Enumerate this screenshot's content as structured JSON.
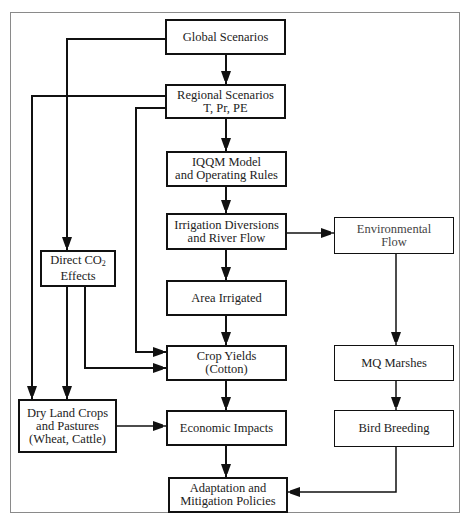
{
  "diagram": {
    "nodes": [
      {
        "id": "global",
        "lines": [
          "Global Scenarios"
        ]
      },
      {
        "id": "regional",
        "lines": [
          "Regional Scenarios",
          "T, Pr, PE"
        ]
      },
      {
        "id": "iqqm",
        "lines": [
          "IQQM Model",
          "and Operating Rules"
        ]
      },
      {
        "id": "irrigation",
        "lines": [
          "Irrigation Diversions",
          "and River Flow"
        ]
      },
      {
        "id": "environmental",
        "lines": [
          "Environmental",
          "Flow"
        ]
      },
      {
        "id": "co2",
        "lines": [
          "Direct CO",
          "2",
          "Effects"
        ]
      },
      {
        "id": "area",
        "lines": [
          "Area Irrigated"
        ]
      },
      {
        "id": "crop",
        "lines": [
          "Crop Yields",
          "(Cotton)"
        ]
      },
      {
        "id": "marshes",
        "lines": [
          "MQ Marshes"
        ]
      },
      {
        "id": "dryland",
        "lines": [
          "Dry Land Crops",
          "and Pastures",
          "(Wheat, Cattle)"
        ]
      },
      {
        "id": "economic",
        "lines": [
          "Economic Impacts"
        ]
      },
      {
        "id": "bird",
        "lines": [
          "Bird Breeding"
        ]
      },
      {
        "id": "adaptation",
        "lines": [
          "Adaptation and",
          "Mitigation Policies"
        ]
      }
    ],
    "edges": [
      {
        "from": "global",
        "to": "regional"
      },
      {
        "from": "global",
        "to": "co2"
      },
      {
        "from": "regional",
        "to": "iqqm"
      },
      {
        "from": "regional",
        "to": "dryland"
      },
      {
        "from": "regional",
        "to": "crop"
      },
      {
        "from": "iqqm",
        "to": "irrigation"
      },
      {
        "from": "irrigation",
        "to": "area"
      },
      {
        "from": "irrigation",
        "to": "environmental"
      },
      {
        "from": "environmental",
        "to": "marshes"
      },
      {
        "from": "co2",
        "to": "dryland"
      },
      {
        "from": "co2",
        "to": "crop"
      },
      {
        "from": "area",
        "to": "crop"
      },
      {
        "from": "crop",
        "to": "economic"
      },
      {
        "from": "marshes",
        "to": "bird"
      },
      {
        "from": "dryland",
        "to": "economic"
      },
      {
        "from": "economic",
        "to": "adaptation"
      },
      {
        "from": "bird",
        "to": "adaptation"
      }
    ]
  }
}
